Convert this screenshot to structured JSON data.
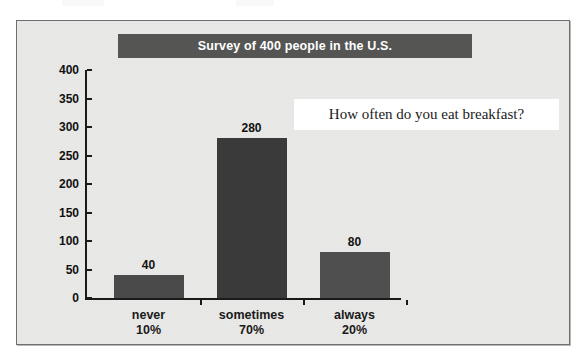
{
  "chart_data": {
    "type": "bar",
    "title": "Survey of 400 people in the U.S.",
    "annotation": "How often do you eat breakfast?",
    "categories": [
      "never",
      "sometimes",
      "always"
    ],
    "category_percents": [
      "10%",
      "70%",
      "20%"
    ],
    "values": [
      40,
      280,
      80
    ],
    "value_labels": [
      "40",
      "280",
      "80"
    ],
    "xlabel": "",
    "ylabel": "",
    "ylim": [
      0,
      400
    ],
    "ytick_labels": [
      "400",
      "350",
      "300",
      "250",
      "200",
      "150",
      "100",
      "50",
      "0"
    ],
    "ytick_values": [
      400,
      350,
      300,
      250,
      200,
      150,
      100,
      50,
      0
    ],
    "grid": false,
    "legend": false,
    "bar_colors": [
      "#4a4a4a",
      "#3a3a3a",
      "#4f4f4f"
    ]
  },
  "style": {
    "frame_bg": "#e9e9e7",
    "frame_border": "#6f6f6f",
    "title_band_bg": "#555554",
    "title_text_color": "#ffffff",
    "annotation_box_bg": "#ffffff",
    "axis_color": "#1a1a1a",
    "text_color": "#111111"
  }
}
